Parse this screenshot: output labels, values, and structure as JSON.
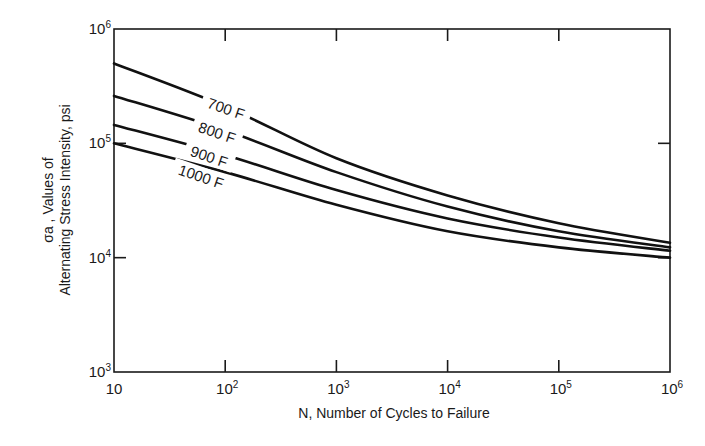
{
  "chart_data": {
    "type": "line",
    "title": "",
    "xlabel": "N, Number of Cycles to Failure",
    "ylabel_line1": "σa , Values of",
    "ylabel_line2": "Alternating Stress Intensity, psi",
    "ylabel": "σa, Values of Alternating Stress Intensity, psi",
    "xscale": "log",
    "yscale": "log",
    "xlim": [
      10,
      1000000
    ],
    "ylim": [
      1000,
      1000000
    ],
    "grid": false,
    "legend": "inline labels on curves",
    "x_ticks": [
      {
        "base": "10",
        "exp": ""
      },
      {
        "base": "10",
        "exp": "2"
      },
      {
        "base": "10",
        "exp": "3"
      },
      {
        "base": "10",
        "exp": "4"
      },
      {
        "base": "10",
        "exp": "5"
      },
      {
        "base": "10",
        "exp": "6"
      }
    ],
    "y_ticks": [
      {
        "base": "10",
        "exp": "6"
      },
      {
        "base": "10",
        "exp": "5"
      },
      {
        "base": "10",
        "exp": "4"
      },
      {
        "base": "10",
        "exp": "3"
      }
    ],
    "x": [
      10,
      100,
      1000,
      10000,
      100000,
      1000000
    ],
    "series": [
      {
        "name": "700 F",
        "values": [
          500000,
          210000,
          74000,
          35000,
          20000,
          13500
        ]
      },
      {
        "name": "800 F",
        "values": [
          260000,
          130000,
          56000,
          28000,
          17000,
          12300
        ]
      },
      {
        "name": "900 F",
        "values": [
          145000,
          79000,
          39000,
          22000,
          15000,
          11500
        ]
      },
      {
        "name": "1000 F",
        "values": [
          100000,
          56000,
          29000,
          17000,
          12300,
          10000
        ]
      }
    ]
  }
}
